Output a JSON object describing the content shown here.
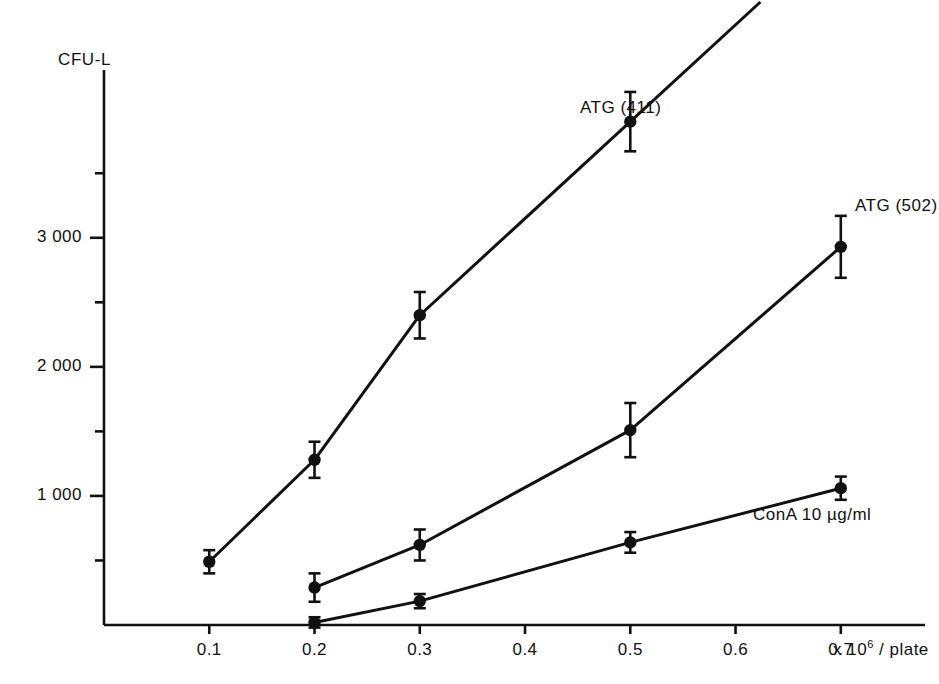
{
  "figure": {
    "background_color": "#ffffff",
    "ink_color": "#111111"
  },
  "axes": {
    "y_title": "CFU-L",
    "x_unit_prefix": "x 10",
    "x_unit_exponent": "6",
    "x_unit_suffix": "/ plate",
    "y_tick_labels": [
      "1 000",
      "2 000",
      "3 000"
    ],
    "x_tick_labels": [
      "0.1",
      "0.2",
      "0.3",
      "0.4",
      "0.5",
      "0.6",
      "0.7"
    ]
  },
  "chart_data": {
    "type": "line",
    "title": "",
    "xlabel": "x 10^6 / plate",
    "ylabel": "CFU-L",
    "xlim": [
      0.0,
      0.78
    ],
    "ylim": [
      0,
      4300
    ],
    "grid": false,
    "legend_position": "inline-right-of-last-point",
    "x_ticks": [
      0.1,
      0.2,
      0.3,
      0.4,
      0.5,
      0.6,
      0.7
    ],
    "y_ticks": [
      1000,
      2000,
      3000
    ],
    "y_minor_ticks": [
      500,
      1500,
      2500,
      3500
    ],
    "error_bars": true,
    "marker": "filled-circle",
    "series": [
      {
        "name": "ATG (411)",
        "label": "ATG (411)",
        "x": [
          0.1,
          0.2,
          0.3,
          0.5
        ],
        "values": [
          490,
          1280,
          2400,
          3900
        ],
        "errors": [
          90,
          140,
          180,
          230
        ]
      },
      {
        "name": "ATG (502)",
        "label": "ATG (502)",
        "x": [
          0.2,
          0.3,
          0.5,
          0.7
        ],
        "values": [
          290,
          620,
          1510,
          2930
        ],
        "errors": [
          110,
          120,
          210,
          240
        ]
      },
      {
        "name": "ConA 10 µg/ml",
        "label": "ConA  10  µg/ml",
        "x": [
          0.2,
          0.3,
          0.5,
          0.7
        ],
        "values": [
          20,
          185,
          640,
          1060
        ],
        "errors": [
          40,
          55,
          80,
          90
        ]
      }
    ]
  }
}
